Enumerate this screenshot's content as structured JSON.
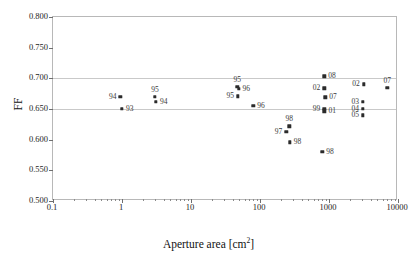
{
  "chart_data": {
    "type": "scatter",
    "title": "",
    "xlabel": "Aperture area [cm2]",
    "xlabel_base": "Aperture area [cm",
    "xlabel_sup": "2",
    "xlabel_tail": "]",
    "ylabel": "FF",
    "xscale": "log",
    "xlim": [
      0.1,
      10000
    ],
    "ylim": [
      0.5,
      0.8
    ],
    "grid": "horizontal gridlines at 0.700 and 0.650",
    "legend": "none",
    "xticks": [
      "0.1",
      "1",
      "10",
      "100",
      "1000",
      "10000"
    ],
    "xtick_values": [
      0.1,
      1,
      10,
      100,
      1000,
      10000
    ],
    "yticks": [
      "0.800",
      "0.750",
      "0.700",
      "0.650",
      "0.600",
      "0.550",
      "0.500"
    ],
    "ytick_values": [
      0.8,
      0.75,
      0.7,
      0.65,
      0.6,
      0.55,
      0.5
    ],
    "gridline_values": [
      0.7,
      0.65
    ],
    "marker_color": "#2b2b2b",
    "points": [
      {
        "label": "94",
        "x": 0.95,
        "y": 0.67,
        "label_pos": "left"
      },
      {
        "label": "93",
        "x": 1.0,
        "y": 0.65,
        "label_pos": "right"
      },
      {
        "label": "95",
        "x": 3.0,
        "y": 0.67,
        "label_pos": "above"
      },
      {
        "label": "94",
        "x": 3.1,
        "y": 0.662,
        "label_pos": "right"
      },
      {
        "label": "95",
        "x": 47.0,
        "y": 0.686,
        "label_pos": "above"
      },
      {
        "label": "96",
        "x": 49.0,
        "y": 0.683,
        "label_pos": "right"
      },
      {
        "label": "95",
        "x": 48.0,
        "y": 0.671,
        "label_pos": "left"
      },
      {
        "label": "96",
        "x": 80.0,
        "y": 0.655,
        "label_pos": "right"
      },
      {
        "label": "98",
        "x": 265.0,
        "y": 0.622,
        "label_pos": "above"
      },
      {
        "label": "97",
        "x": 240.0,
        "y": 0.613,
        "label_pos": "left"
      },
      {
        "label": "98",
        "x": 270.0,
        "y": 0.596,
        "label_pos": "right"
      },
      {
        "label": "08",
        "x": 850.0,
        "y": 0.703,
        "label_pos": "right"
      },
      {
        "label": "02",
        "x": 850.0,
        "y": 0.684,
        "label_pos": "left"
      },
      {
        "label": "07",
        "x": 880.0,
        "y": 0.669,
        "label_pos": "right"
      },
      {
        "label": "99",
        "x": 850.0,
        "y": 0.65,
        "label_pos": "left"
      },
      {
        "label": "01",
        "x": 860.0,
        "y": 0.646,
        "label_pos": "right"
      },
      {
        "label": "98",
        "x": 800.0,
        "y": 0.58,
        "label_pos": "right"
      },
      {
        "label": "02",
        "x": 3200.0,
        "y": 0.69,
        "label_pos": "left"
      },
      {
        "label": "03",
        "x": 3100.0,
        "y": 0.662,
        "label_pos": "left"
      },
      {
        "label": "04",
        "x": 3100.0,
        "y": 0.65,
        "label_pos": "left"
      },
      {
        "label": "05",
        "x": 3100.0,
        "y": 0.64,
        "label_pos": "left"
      },
      {
        "label": "07",
        "x": 7000.0,
        "y": 0.685,
        "label_pos": "above"
      }
    ]
  }
}
